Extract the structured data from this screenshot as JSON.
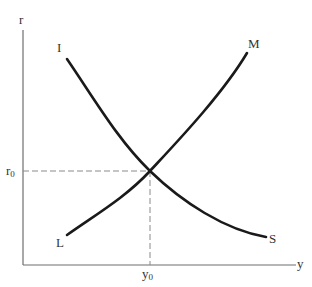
{
  "diagram": {
    "axes": {
      "y_label": "r",
      "x_label": "y"
    },
    "curves": [
      {
        "id": "IS",
        "start_label": "I",
        "end_label": "S",
        "shape": "downward-sloping, convex"
      },
      {
        "id": "LM",
        "start_label": "L",
        "end_label": "M",
        "shape": "upward-sloping, convex"
      }
    ],
    "equilibrium": {
      "r_label": "r",
      "r_sub": "0",
      "y_label": "y",
      "y_sub": "0"
    },
    "colors": {
      "curve": "#1a1a1a",
      "axis": "#6e6e6e",
      "guide": "#8a8a8a",
      "text": "#333333",
      "background": "#ffffff"
    }
  }
}
